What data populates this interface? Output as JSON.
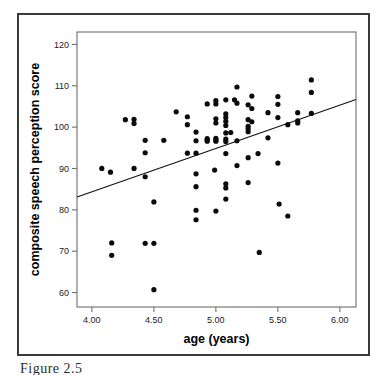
{
  "figure": {
    "caption": "Figure 2.5",
    "border_color": "#3a3a3a",
    "background_color": "#ffffff"
  },
  "chart_data": {
    "type": "scatter",
    "title": "",
    "xlabel": "age (years)",
    "ylabel": "composite speech perception score",
    "xlim": [
      3.88,
      6.13
    ],
    "ylim": [
      56.5,
      123.0
    ],
    "grid": false,
    "legend": "none",
    "point_color": "#0b0b0b",
    "xticks": [
      "4.00",
      "4.50",
      "5.00",
      "5.50",
      "6.00"
    ],
    "xtick_values": [
      4.0,
      4.5,
      5.0,
      5.5,
      6.0
    ],
    "yticks": [
      "60",
      "70",
      "80",
      "90",
      "100",
      "110",
      "120"
    ],
    "ytick_values": [
      60,
      70,
      80,
      90,
      100,
      110,
      120
    ],
    "points": [
      [
        4.08,
        90.0
      ],
      [
        4.15,
        89.1
      ],
      [
        4.16,
        72.0
      ],
      [
        4.16,
        69.0
      ],
      [
        4.27,
        101.8
      ],
      [
        4.34,
        101.9
      ],
      [
        4.34,
        100.9
      ],
      [
        4.34,
        90.0
      ],
      [
        4.43,
        96.8
      ],
      [
        4.43,
        93.8
      ],
      [
        4.43,
        88.0
      ],
      [
        4.43,
        71.9
      ],
      [
        4.5,
        81.9
      ],
      [
        4.5,
        71.9
      ],
      [
        4.5,
        60.7
      ],
      [
        4.58,
        96.8
      ],
      [
        4.68,
        103.7
      ],
      [
        4.77,
        102.5
      ],
      [
        4.77,
        100.6
      ],
      [
        4.77,
        93.7
      ],
      [
        4.84,
        98.8
      ],
      [
        4.84,
        96.7
      ],
      [
        4.84,
        93.7
      ],
      [
        4.84,
        88.7
      ],
      [
        4.84,
        85.6
      ],
      [
        4.84,
        79.9
      ],
      [
        4.84,
        77.6
      ],
      [
        4.93,
        105.6
      ],
      [
        4.93,
        97.2
      ],
      [
        4.93,
        96.9
      ],
      [
        4.93,
        96.6
      ],
      [
        4.99,
        89.6
      ],
      [
        5.0,
        106.4
      ],
      [
        5.0,
        105.6
      ],
      [
        5.0,
        102.0
      ],
      [
        5.0,
        101.0
      ],
      [
        5.0,
        97.3
      ],
      [
        5.0,
        96.9
      ],
      [
        5.0,
        96.6
      ],
      [
        5.0,
        79.7
      ],
      [
        5.08,
        106.6
      ],
      [
        5.08,
        103.2
      ],
      [
        5.08,
        102.3
      ],
      [
        5.08,
        101.4
      ],
      [
        5.08,
        100.4
      ],
      [
        5.08,
        98.6
      ],
      [
        5.08,
        97.1
      ],
      [
        5.08,
        96.5
      ],
      [
        5.08,
        93.6
      ],
      [
        5.08,
        86.3
      ],
      [
        5.08,
        85.3
      ],
      [
        5.08,
        82.6
      ],
      [
        5.12,
        98.7
      ],
      [
        5.15,
        106.6
      ],
      [
        5.17,
        109.7
      ],
      [
        5.17,
        105.8
      ],
      [
        5.17,
        96.7
      ],
      [
        5.17,
        90.7
      ],
      [
        5.26,
        105.4
      ],
      [
        5.26,
        101.8
      ],
      [
        5.26,
        100.2
      ],
      [
        5.26,
        99.6
      ],
      [
        5.26,
        98.9
      ],
      [
        5.26,
        92.6
      ],
      [
        5.26,
        86.6
      ],
      [
        5.29,
        107.5
      ],
      [
        5.29,
        104.5
      ],
      [
        5.29,
        101.3
      ],
      [
        5.34,
        93.6
      ],
      [
        5.35,
        69.7
      ],
      [
        5.42,
        103.5
      ],
      [
        5.42,
        97.4
      ],
      [
        5.5,
        107.4
      ],
      [
        5.5,
        105.5
      ],
      [
        5.5,
        102.3
      ],
      [
        5.5,
        91.3
      ],
      [
        5.51,
        81.4
      ],
      [
        5.58,
        100.6
      ],
      [
        5.58,
        78.5
      ],
      [
        5.66,
        103.5
      ],
      [
        5.66,
        101.5
      ],
      [
        5.66,
        101.0
      ],
      [
        5.77,
        111.4
      ],
      [
        5.77,
        108.4
      ],
      [
        5.77,
        103.3
      ]
    ],
    "fit_line": {
      "label": "linear regression line",
      "x_start": 3.88,
      "y_start": 83.1,
      "x_end": 6.13,
      "y_end": 106.7
    }
  }
}
